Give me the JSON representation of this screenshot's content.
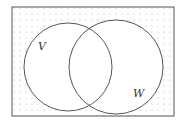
{
  "diagram": {
    "type": "venn",
    "universe": {
      "x": 12,
      "y": 7,
      "width": 162,
      "height": 109,
      "shading": "dotted"
    },
    "sets": [
      {
        "label": "V",
        "cx": 68,
        "cy": 67,
        "r": 44,
        "label_x": 38,
        "label_y": 50
      },
      {
        "label": "W",
        "cx": 116,
        "cy": 67,
        "r": 47,
        "label_x": 133,
        "label_y": 97
      }
    ],
    "shaded_region": "complement of (V ∪ W)",
    "colors": {
      "stroke": "#555555",
      "dot": "#aaaaaa",
      "background": "#ffffff"
    }
  }
}
